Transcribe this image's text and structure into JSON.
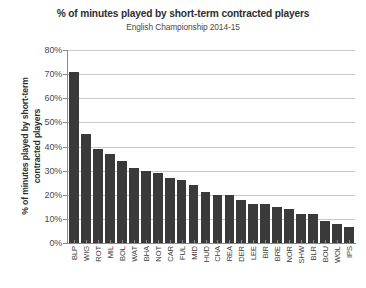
{
  "chart_data": {
    "type": "bar",
    "title": "% of minutes played by short-term contracted players",
    "subtitle": "English Championship 2014-15",
    "xlabel": "",
    "ylabel": "% of minutes played by short-term contracted players",
    "ylabel_line1": "% of minutes played by short-term",
    "ylabel_line2": "contracted players",
    "ylim": [
      0,
      80
    ],
    "ytick_labels": [
      "80%",
      "70%",
      "60%",
      "50%",
      "40%",
      "30%",
      "20%",
      "10%",
      "0%"
    ],
    "ytick_values": [
      80,
      70,
      60,
      50,
      40,
      30,
      20,
      10,
      0
    ],
    "grid": true,
    "legend": false,
    "bar_color": "#3a3a3a",
    "grid_color": "#c9c9c9",
    "axis_color": "#8a8a8a",
    "categories": [
      "BLP",
      "WIG",
      "ROT",
      "MIL",
      "BOL",
      "WAT",
      "BHA",
      "NOT",
      "CAR",
      "FUL",
      "MID",
      "HUD",
      "CHA",
      "REA",
      "DER",
      "LEE",
      "BIR",
      "BRE",
      "NOR",
      "SHW",
      "BLR",
      "BOU",
      "WOL",
      "IPS"
    ],
    "values": [
      71,
      45,
      39,
      37,
      34,
      31,
      30,
      29,
      27,
      26,
      24,
      21,
      20,
      20,
      18,
      16,
      16,
      15,
      14,
      12,
      12,
      9,
      8,
      6.5
    ]
  }
}
